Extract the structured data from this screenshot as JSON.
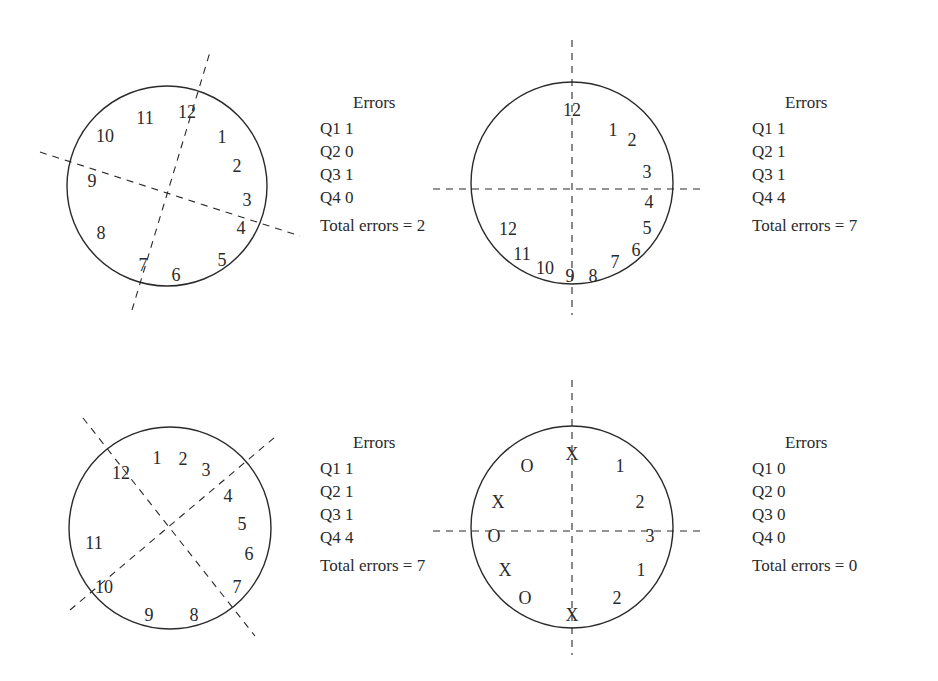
{
  "panels": [
    {
      "id": "clock-1",
      "circle": {
        "cx": 167,
        "cy": 186,
        "r": 100
      },
      "axes": [
        {
          "x1": 132,
          "y1": 310,
          "x2": 210,
          "y2": 52
        },
        {
          "x1": 40,
          "y1": 152,
          "x2": 300,
          "y2": 236
        }
      ],
      "numbers": [
        {
          "label": "11",
          "x": 145,
          "y": 118
        },
        {
          "label": "12",
          "x": 187,
          "y": 112
        },
        {
          "label": "10",
          "x": 105,
          "y": 136
        },
        {
          "label": "1",
          "x": 222,
          "y": 137
        },
        {
          "label": "2",
          "x": 237,
          "y": 166
        },
        {
          "label": "9",
          "x": 92,
          "y": 181
        },
        {
          "label": "3",
          "x": 247,
          "y": 200
        },
        {
          "label": "4",
          "x": 241,
          "y": 228
        },
        {
          "label": "8",
          "x": 101,
          "y": 233
        },
        {
          "label": "5",
          "x": 222,
          "y": 260
        },
        {
          "label": "7",
          "x": 143,
          "y": 265
        },
        {
          "label": "6",
          "x": 176,
          "y": 275
        }
      ],
      "errors": {
        "title": "Errors",
        "rows": [
          {
            "label": "Q1",
            "value": "1"
          },
          {
            "label": "Q2",
            "value": "0"
          },
          {
            "label": "Q3",
            "value": "1"
          },
          {
            "label": "Q4",
            "value": "0"
          }
        ],
        "total_label": "Total errors = 2"
      }
    },
    {
      "id": "clock-2",
      "circle": {
        "cx": 572,
        "cy": 183,
        "r": 101
      },
      "axes": [
        {
          "x1": 572,
          "y1": 40,
          "x2": 572,
          "y2": 315
        },
        {
          "x1": 433,
          "y1": 189,
          "x2": 700,
          "y2": 189
        }
      ],
      "numbers": [
        {
          "label": "12",
          "x": 572,
          "y": 110
        },
        {
          "label": "1",
          "x": 613,
          "y": 130
        },
        {
          "label": "2",
          "x": 632,
          "y": 140
        },
        {
          "label": "3",
          "x": 647,
          "y": 172
        },
        {
          "label": "4",
          "x": 649,
          "y": 202
        },
        {
          "label": "5",
          "x": 647,
          "y": 228
        },
        {
          "label": "12",
          "x": 508,
          "y": 229
        },
        {
          "label": "6",
          "x": 636,
          "y": 250
        },
        {
          "label": "11",
          "x": 522,
          "y": 254
        },
        {
          "label": "7",
          "x": 615,
          "y": 262
        },
        {
          "label": "10",
          "x": 545,
          "y": 268
        },
        {
          "label": "9",
          "x": 570,
          "y": 276
        },
        {
          "label": "8",
          "x": 593,
          "y": 276
        }
      ],
      "errors": {
        "title": "Errors",
        "rows": [
          {
            "label": "Q1",
            "value": "1"
          },
          {
            "label": "Q2",
            "value": "1"
          },
          {
            "label": "Q3",
            "value": "1"
          },
          {
            "label": "Q4",
            "value": "4"
          }
        ],
        "total_label": "Total errors = 7"
      }
    },
    {
      "id": "clock-3",
      "circle": {
        "cx": 170,
        "cy": 528,
        "r": 101
      },
      "axes": [
        {
          "x1": 83,
          "y1": 418,
          "x2": 255,
          "y2": 636
        },
        {
          "x1": 70,
          "y1": 610,
          "x2": 275,
          "y2": 437
        }
      ],
      "numbers": [
        {
          "label": "1",
          "x": 157,
          "y": 458
        },
        {
          "label": "2",
          "x": 183,
          "y": 459
        },
        {
          "label": "12",
          "x": 121,
          "y": 473
        },
        {
          "label": "3",
          "x": 206,
          "y": 470
        },
        {
          "label": "4",
          "x": 228,
          "y": 496
        },
        {
          "label": "5",
          "x": 242,
          "y": 524
        },
        {
          "label": "11",
          "x": 94,
          "y": 543
        },
        {
          "label": "6",
          "x": 249,
          "y": 554
        },
        {
          "label": "10",
          "x": 104,
          "y": 587
        },
        {
          "label": "7",
          "x": 237,
          "y": 587
        },
        {
          "label": "9",
          "x": 149,
          "y": 615
        },
        {
          "label": "8",
          "x": 194,
          "y": 615
        }
      ],
      "errors": {
        "title": "Errors",
        "rows": [
          {
            "label": "Q1",
            "value": "1"
          },
          {
            "label": "Q2",
            "value": "1"
          },
          {
            "label": "Q3",
            "value": "1"
          },
          {
            "label": "Q4",
            "value": "4"
          }
        ],
        "total_label": "Total errors = 7"
      }
    },
    {
      "id": "clock-4",
      "circle": {
        "cx": 572,
        "cy": 527,
        "r": 101
      },
      "axes": [
        {
          "x1": 572,
          "y1": 380,
          "x2": 572,
          "y2": 655
        },
        {
          "x1": 433,
          "y1": 531,
          "x2": 700,
          "y2": 531
        }
      ],
      "numbers": [
        {
          "label": "X",
          "x": 572,
          "y": 454
        },
        {
          "label": "O",
          "x": 527,
          "y": 466
        },
        {
          "label": "1",
          "x": 620,
          "y": 466
        },
        {
          "label": "X",
          "x": 498,
          "y": 502
        },
        {
          "label": "2",
          "x": 640,
          "y": 502
        },
        {
          "label": "O",
          "x": 494,
          "y": 536
        },
        {
          "label": "3",
          "x": 650,
          "y": 536
        },
        {
          "label": "X",
          "x": 505,
          "y": 570
        },
        {
          "label": "1",
          "x": 641,
          "y": 570
        },
        {
          "label": "O",
          "x": 525,
          "y": 598
        },
        {
          "label": "2",
          "x": 617,
          "y": 598
        },
        {
          "label": "X",
          "x": 572,
          "y": 615
        }
      ],
      "errors": {
        "title": "Errors",
        "rows": [
          {
            "label": "Q1",
            "value": "0"
          },
          {
            "label": "Q2",
            "value": "0"
          },
          {
            "label": "Q3",
            "value": "0"
          },
          {
            "label": "Q4",
            "value": "0"
          }
        ],
        "total_label": "Total errors = 0"
      }
    }
  ],
  "errors_positions": [
    {
      "left": 320,
      "top": 91
    },
    {
      "left": 752,
      "top": 91
    },
    {
      "left": 320,
      "top": 431
    },
    {
      "left": 752,
      "top": 431
    }
  ],
  "colors": {
    "stroke": "#2a2a2a",
    "background": "#ffffff"
  }
}
